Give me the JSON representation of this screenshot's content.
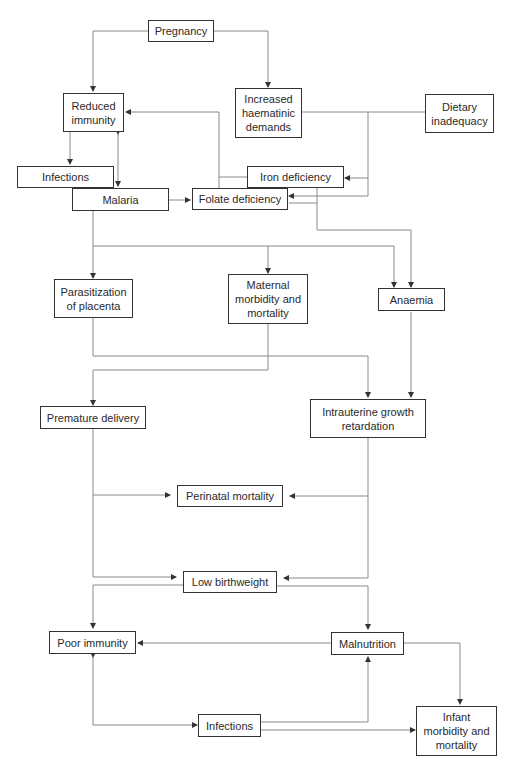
{
  "diagram": {
    "nodes": {
      "pregnancy": "Pregnancy",
      "reduced_immunity": "Reduced\nimmunity",
      "increased_haematinic_demands": "Increased\nhaematinic\ndemands",
      "dietary_inadequacy": "Dietary\ninadequacy",
      "infections_top": "Infections",
      "malaria": "Malaria",
      "iron_deficiency": "Iron deficiency",
      "folate_deficiency": "Folate deficiency",
      "parasitization_of_placenta": "Parasitization\nof placenta",
      "maternal_morbidity_mortality": "Maternal\nmorbidity and\nmortality",
      "anaemia": "Anaemia",
      "premature_delivery": "Premature delivery",
      "intrauterine_growth_retardation": "Intrauterine growth\nretardation",
      "perinatal_mortality": "Perinatal mortality",
      "low_birthweight": "Low birthweight",
      "poor_immunity": "Poor immunity",
      "malnutrition": "Malnutrition",
      "infections_bottom": "Infections",
      "infant_morbidity_mortality": "Infant\nmorbidity and\nmortality"
    },
    "edges": [
      [
        "Pregnancy",
        "Reduced immunity"
      ],
      [
        "Pregnancy",
        "Increased haematinic demands"
      ],
      [
        "Reduced immunity",
        "Infections"
      ],
      [
        "Reduced immunity",
        "Malaria"
      ],
      [
        "Malaria",
        "Reduced immunity"
      ],
      [
        "Iron deficiency",
        "Reduced immunity"
      ],
      [
        "Folate deficiency",
        "Reduced immunity"
      ],
      [
        "Increased haematinic demands",
        "Iron deficiency"
      ],
      [
        "Increased haematinic demands",
        "Folate deficiency"
      ],
      [
        "Dietary inadequacy",
        "Iron deficiency"
      ],
      [
        "Dietary inadequacy",
        "Folate deficiency"
      ],
      [
        "Malaria",
        "Folate deficiency"
      ],
      [
        "Malaria",
        "Parasitization of placenta"
      ],
      [
        "Malaria",
        "Maternal morbidity and mortality"
      ],
      [
        "Malaria",
        "Anaemia"
      ],
      [
        "Iron deficiency",
        "Anaemia"
      ],
      [
        "Folate deficiency",
        "Anaemia"
      ],
      [
        "Parasitization of placenta",
        "Intrauterine growth retardation"
      ],
      [
        "Maternal morbidity and mortality",
        "Premature delivery"
      ],
      [
        "Anaemia",
        "Intrauterine growth retardation"
      ],
      [
        "Premature delivery",
        "Perinatal mortality"
      ],
      [
        "Premature delivery",
        "Low birthweight"
      ],
      [
        "Intrauterine growth retardation",
        "Perinatal mortality"
      ],
      [
        "Intrauterine growth retardation",
        "Low birthweight"
      ],
      [
        "Low birthweight",
        "Poor immunity"
      ],
      [
        "Low birthweight",
        "Malnutrition"
      ],
      [
        "Malnutrition",
        "Poor immunity"
      ],
      [
        "Malnutrition",
        "Infant morbidity and mortality"
      ],
      [
        "Poor immunity",
        "Infections"
      ],
      [
        "Infections",
        "Poor immunity"
      ],
      [
        "Infections",
        "Malnutrition"
      ],
      [
        "Infections",
        "Infant morbidity and mortality"
      ]
    ],
    "line_color": "#8a8a8a",
    "border_color": "#333333"
  }
}
